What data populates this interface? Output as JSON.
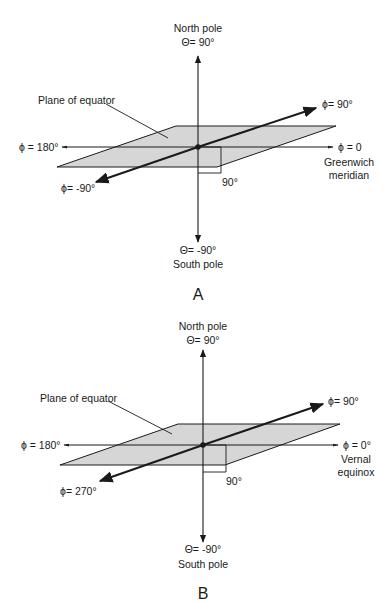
{
  "panels": [
    {
      "id": "A",
      "caption": "A",
      "north_label": "North pole",
      "north_theta": "Θ= 90°",
      "south_theta": "Θ= -90°",
      "south_label": "South pole",
      "plane_label": "Plane of equator",
      "phi_left": "ϕ = 180°",
      "phi_right": "ϕ = 0",
      "phi_right_sub1": "Greenwich",
      "phi_right_sub2": "meridian",
      "phi_up": "ϕ= 90°",
      "phi_down": "ϕ= -90°",
      "right_angle": "90°"
    },
    {
      "id": "B",
      "caption": "B",
      "north_label": "North pole",
      "north_theta": "Θ= 90°",
      "south_theta": "Θ= -90°",
      "south_label": "South pole",
      "plane_label": "Plane of equator",
      "phi_left": "ϕ = 180°",
      "phi_right": "ϕ = 0°",
      "phi_right_sub1": "Vernal",
      "phi_right_sub2": "equinox",
      "phi_up": "ϕ= 90°",
      "phi_down": "ϕ= 270°",
      "right_angle": "90°"
    }
  ],
  "colors": {
    "plane_fill": "#d6d6d6",
    "line": "#1a1a1a",
    "background": "#ffffff"
  }
}
